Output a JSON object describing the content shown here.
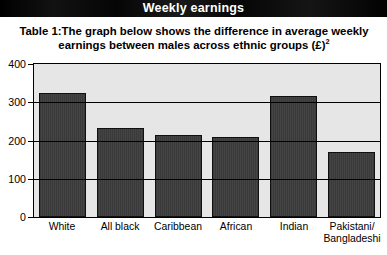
{
  "header": {
    "title": "Weekly earnings"
  },
  "caption": {
    "label": "Table 1:",
    "line1": "The graph below shows the difference in average weekly",
    "line2": "earnings between males across ethnic groups (£)",
    "superscript": "2"
  },
  "chart_data": {
    "type": "bar",
    "title": "",
    "xlabel": "",
    "ylabel": "",
    "categories": [
      "White",
      "All black",
      "Caribbean",
      "African",
      "Indian",
      "Pakistani/\nBangladeshi"
    ],
    "values": [
      325,
      234,
      214,
      209,
      316,
      170
    ],
    "ylim": [
      0,
      400
    ],
    "yticks": [
      0,
      100,
      200,
      300,
      400
    ],
    "ytick_labels": [
      "0",
      "100",
      "200",
      "300",
      "400"
    ],
    "grid": true,
    "legend": false,
    "colors": {
      "bar_fill": "#3b3b3b",
      "bar_edge": "#101010",
      "plot_background": "#e6e6e6",
      "axis": "#000000",
      "title_bar": "#0b0b0b",
      "title_text": "#ffffff"
    }
  }
}
